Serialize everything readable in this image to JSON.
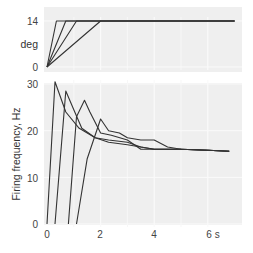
{
  "chart_data": [
    {
      "type": "line",
      "title": "",
      "xlabel": "",
      "ylabel": "deg",
      "xlim": [
        0,
        7
      ],
      "ylim": [
        0,
        14
      ],
      "yticks": [
        0,
        14
      ],
      "grid": true,
      "background": "#efefef",
      "line_color": "#333333",
      "series": [
        {
          "name": "ramp 1",
          "x": [
            0,
            0.35,
            7.0
          ],
          "y": [
            0,
            14,
            14
          ]
        },
        {
          "name": "ramp 2",
          "x": [
            0,
            0.7,
            7.0
          ],
          "y": [
            0,
            14,
            14
          ]
        },
        {
          "name": "ramp 3",
          "x": [
            0,
            1.1,
            7.0
          ],
          "y": [
            0,
            14,
            14
          ]
        },
        {
          "name": "ramp 4",
          "x": [
            0,
            2.0,
            7.0
          ],
          "y": [
            0,
            14,
            14
          ]
        }
      ]
    },
    {
      "type": "line",
      "title": "",
      "xlabel": "",
      "ylabel": "Firing frequency, Hz",
      "xlim": [
        0,
        7
      ],
      "ylim": [
        0,
        30
      ],
      "xticks": [
        0,
        2,
        4,
        6
      ],
      "xtick_labels": [
        "0",
        "2",
        "4",
        "6 s"
      ],
      "yticks": [
        0,
        10,
        20,
        30
      ],
      "grid": true,
      "background": "#efefef",
      "line_color": "#333333",
      "series": [
        {
          "name": "ramp 1",
          "x": [
            0.0,
            0.3,
            0.7,
            1.2,
            1.8,
            2.3,
            3.0,
            3.5,
            4.0,
            5.0,
            6.0,
            6.8
          ],
          "y": [
            0,
            30.5,
            24,
            20.5,
            18.5,
            17.5,
            17,
            16.5,
            16,
            16,
            15.8,
            15.6
          ]
        },
        {
          "name": "ramp 2",
          "x": [
            0.3,
            0.7,
            1.0,
            1.3,
            1.8,
            2.3,
            3.0,
            3.5,
            4.0,
            5.0,
            6.0,
            6.8
          ],
          "y": [
            0,
            28.5,
            24.5,
            20.5,
            18.5,
            18,
            17.5,
            16.5,
            16,
            16,
            15.8,
            15.6
          ]
        },
        {
          "name": "ramp 3",
          "x": [
            0.8,
            1.1,
            1.4,
            1.6,
            2.0,
            2.4,
            3.0,
            3.5,
            4.0,
            5.0,
            6.0,
            6.8
          ],
          "y": [
            0,
            23,
            26.5,
            24,
            19.5,
            19,
            18,
            16,
            16,
            16,
            15.8,
            15.6
          ]
        },
        {
          "name": "ramp 4",
          "x": [
            1.1,
            1.5,
            2.0,
            2.3,
            2.7,
            3.0,
            3.5,
            4.0,
            4.5,
            5.0,
            6.0,
            6.8
          ],
          "y": [
            0,
            14,
            22.5,
            20,
            19.5,
            18.5,
            18,
            18,
            16.5,
            16,
            15.8,
            15.6
          ]
        }
      ]
    }
  ],
  "labels": {
    "top_ylabel": "deg",
    "top_ytick_14": "14",
    "top_ytick_0": "0",
    "bottom_ylabel": "Firing frequency, Hz",
    "bottom_yticks": [
      "30",
      "20",
      "10",
      "0"
    ],
    "xticks": [
      "0",
      "2",
      "4",
      "6 s"
    ]
  }
}
